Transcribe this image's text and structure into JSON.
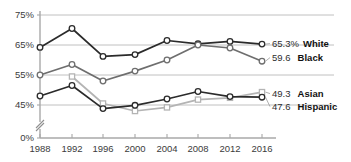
{
  "chart_data": {
    "type": "line",
    "title": "",
    "subtitle": "",
    "xlabel": "",
    "ylabel": "",
    "x": [
      1988,
      1992,
      1996,
      2000,
      2004,
      2008,
      2012,
      2016
    ],
    "categories": [
      "1988",
      "1992",
      "1996",
      "2000",
      "2004",
      "2008",
      "2012",
      "2016"
    ],
    "y_tick_labels": [
      "75%",
      "65%",
      "55%",
      "45%",
      "0%"
    ],
    "y_tick_values": [
      75,
      65,
      55,
      45,
      0
    ],
    "ylim": [
      40,
      75
    ],
    "y_axis_break": true,
    "grid": "horizontal",
    "legend_position": "right-end-labels",
    "series": [
      {
        "name": "White",
        "end_value_label": "65.3%",
        "color": "#2b2b2b",
        "marker": "circle",
        "values": [
          64.2,
          70.5,
          61.2,
          61.8,
          66.5,
          65.4,
          66.2,
          65.3
        ]
      },
      {
        "name": "Black",
        "end_value_label": "59.6",
        "color": "#6e6e6e",
        "marker": "circle",
        "values": [
          55.0,
          58.5,
          53.0,
          56.3,
          60.0,
          65.0,
          64.0,
          59.6
        ]
      },
      {
        "name": "Asian",
        "end_value_label": "49.3",
        "color": "#b4b4b4",
        "marker": "square",
        "values": [
          null,
          54.5,
          45.5,
          43.0,
          44.2,
          46.8,
          47.4,
          49.3
        ]
      },
      {
        "name": "Hispanic",
        "end_value_label": "47.6",
        "color": "#2b2b2b",
        "marker": "circle",
        "values": [
          48.0,
          51.5,
          43.8,
          44.9,
          47.0,
          49.5,
          47.8,
          47.6
        ]
      }
    ]
  },
  "layout": {
    "plot_left": 40,
    "plot_right": 262,
    "axis_x": 40,
    "baseline_y": 138,
    "y_pixel_map": [
      {
        "value": 75,
        "y": 15
      },
      {
        "value": 65,
        "y": 45
      },
      {
        "value": 55,
        "y": 75
      },
      {
        "value": 45,
        "y": 105
      }
    ],
    "x_tick_pixels": [
      40,
      72,
      103,
      135,
      167,
      198,
      230,
      262
    ],
    "x_label_y": 152,
    "label_column_x": 272,
    "end_label_rows": [
      {
        "series": "White",
        "y": 47
      },
      {
        "series": "Black",
        "y": 61
      },
      {
        "series": "Asian",
        "y": 97
      },
      {
        "series": "Hispanic",
        "y": 110
      }
    ]
  }
}
